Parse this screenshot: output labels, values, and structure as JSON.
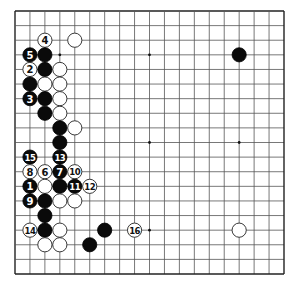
{
  "board": {
    "size": 19,
    "colors": {
      "black": "#0a0a0a",
      "white": "#ffffff",
      "line": "#555555",
      "background": "#ffffff"
    },
    "hoshi": [
      [
        3,
        3
      ],
      [
        3,
        9
      ],
      [
        3,
        15
      ],
      [
        9,
        3
      ],
      [
        9,
        9
      ],
      [
        9,
        15
      ],
      [
        15,
        3
      ],
      [
        15,
        9
      ],
      [
        15,
        15
      ]
    ],
    "stones": [
      {
        "row": 2,
        "col": 2,
        "color": "white",
        "label": "4"
      },
      {
        "row": 2,
        "col": 4,
        "color": "white",
        "label": ""
      },
      {
        "row": 3,
        "col": 1,
        "color": "black",
        "label": "5"
      },
      {
        "row": 3,
        "col": 2,
        "color": "black",
        "label": ""
      },
      {
        "row": 3,
        "col": 15,
        "color": "black",
        "label": ""
      },
      {
        "row": 4,
        "col": 1,
        "color": "white",
        "label": "2"
      },
      {
        "row": 4,
        "col": 2,
        "color": "black",
        "label": ""
      },
      {
        "row": 4,
        "col": 3,
        "color": "white",
        "label": ""
      },
      {
        "row": 5,
        "col": 1,
        "color": "black",
        "label": ""
      },
      {
        "row": 5,
        "col": 2,
        "color": "white",
        "label": ""
      },
      {
        "row": 5,
        "col": 3,
        "color": "white",
        "label": ""
      },
      {
        "row": 6,
        "col": 1,
        "color": "black",
        "label": "3"
      },
      {
        "row": 6,
        "col": 2,
        "color": "black",
        "label": ""
      },
      {
        "row": 6,
        "col": 3,
        "color": "white",
        "label": ""
      },
      {
        "row": 7,
        "col": 2,
        "color": "black",
        "label": ""
      },
      {
        "row": 7,
        "col": 3,
        "color": "white",
        "label": ""
      },
      {
        "row": 8,
        "col": 3,
        "color": "black",
        "label": ""
      },
      {
        "row": 8,
        "col": 4,
        "color": "white",
        "label": ""
      },
      {
        "row": 9,
        "col": 3,
        "color": "black",
        "label": ""
      },
      {
        "row": 10,
        "col": 1,
        "color": "black",
        "label": "15"
      },
      {
        "row": 10,
        "col": 3,
        "color": "black",
        "label": "13"
      },
      {
        "row": 11,
        "col": 1,
        "color": "white",
        "label": "8"
      },
      {
        "row": 11,
        "col": 2,
        "color": "white",
        "label": "6"
      },
      {
        "row": 11,
        "col": 3,
        "color": "black",
        "label": "7"
      },
      {
        "row": 11,
        "col": 4,
        "color": "white",
        "label": "10"
      },
      {
        "row": 12,
        "col": 1,
        "color": "black",
        "label": "1"
      },
      {
        "row": 12,
        "col": 2,
        "color": "white",
        "label": ""
      },
      {
        "row": 12,
        "col": 3,
        "color": "black",
        "label": ""
      },
      {
        "row": 12,
        "col": 4,
        "color": "black",
        "label": "11"
      },
      {
        "row": 12,
        "col": 5,
        "color": "white",
        "label": "12"
      },
      {
        "row": 13,
        "col": 1,
        "color": "black",
        "label": "9"
      },
      {
        "row": 13,
        "col": 2,
        "color": "black",
        "label": ""
      },
      {
        "row": 13,
        "col": 3,
        "color": "white",
        "label": ""
      },
      {
        "row": 13,
        "col": 4,
        "color": "white",
        "label": ""
      },
      {
        "row": 14,
        "col": 2,
        "color": "black",
        "label": ""
      },
      {
        "row": 15,
        "col": 1,
        "color": "white",
        "label": "14"
      },
      {
        "row": 15,
        "col": 2,
        "color": "black",
        "label": ""
      },
      {
        "row": 15,
        "col": 3,
        "color": "white",
        "label": ""
      },
      {
        "row": 15,
        "col": 6,
        "color": "black",
        "label": ""
      },
      {
        "row": 15,
        "col": 8,
        "color": "white",
        "label": "16"
      },
      {
        "row": 15,
        "col": 15,
        "color": "white",
        "label": ""
      },
      {
        "row": 16,
        "col": 2,
        "color": "white",
        "label": ""
      },
      {
        "row": 16,
        "col": 3,
        "color": "white",
        "label": ""
      },
      {
        "row": 16,
        "col": 5,
        "color": "black",
        "label": ""
      }
    ]
  }
}
